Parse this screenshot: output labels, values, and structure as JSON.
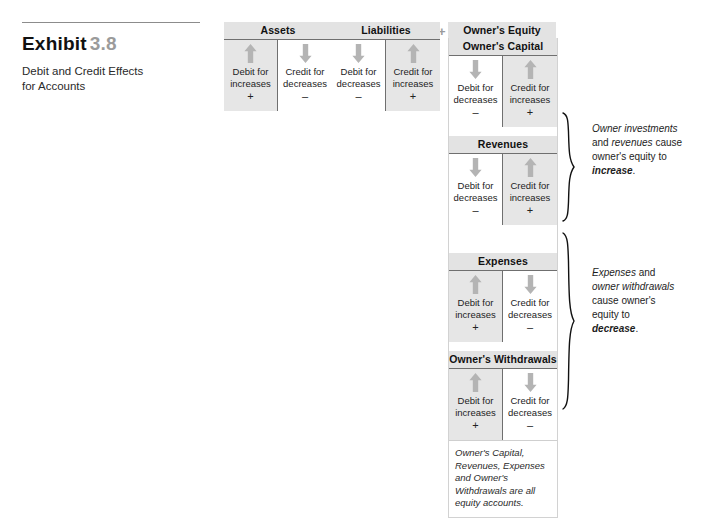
{
  "exhibit": {
    "label": "Exhibit",
    "number": "3.8",
    "subtitle_line1": "Debit and Credit Effects",
    "subtitle_line2": "for Accounts"
  },
  "operators": {
    "equals": "=",
    "plus": "+"
  },
  "accounts": [
    {
      "id": "assets",
      "title": "Assets",
      "debit": {
        "line1": "Debit for",
        "line2": "increases",
        "sign": "+",
        "arrow": "up-arrow-icon",
        "shaded": true
      },
      "credit": {
        "line1": "Credit for",
        "line2": "decreases",
        "sign": "–",
        "arrow": "down-arrow-icon",
        "shaded": false
      }
    },
    {
      "id": "liabilities",
      "title": "Liabilities",
      "debit": {
        "line1": "Debit for",
        "line2": "decreases",
        "sign": "–",
        "arrow": "down-arrow-icon",
        "shaded": false
      },
      "credit": {
        "line1": "Credit for",
        "line2": "increases",
        "sign": "+",
        "arrow": "up-arrow-icon",
        "shaded": true
      }
    },
    {
      "id": "owners-capital",
      "title": "Owner's Capital",
      "debit": {
        "line1": "Debit for",
        "line2": "decreases",
        "sign": "–",
        "arrow": "down-arrow-icon",
        "shaded": false
      },
      "credit": {
        "line1": "Credit for",
        "line2": "increases",
        "sign": "+",
        "arrow": "up-arrow-icon",
        "shaded": true
      }
    },
    {
      "id": "revenues",
      "title": "Revenues",
      "debit": {
        "line1": "Debit for",
        "line2": "decreases",
        "sign": "–",
        "arrow": "down-arrow-icon",
        "shaded": false
      },
      "credit": {
        "line1": "Credit for",
        "line2": "increases",
        "sign": "+",
        "arrow": "up-arrow-icon",
        "shaded": true
      }
    },
    {
      "id": "expenses",
      "title": "Expenses",
      "debit": {
        "line1": "Debit for",
        "line2": "increases",
        "sign": "+",
        "arrow": "up-arrow-icon",
        "shaded": true
      },
      "credit": {
        "line1": "Credit for",
        "line2": "decreases",
        "sign": "–",
        "arrow": "down-arrow-icon",
        "shaded": false
      }
    },
    {
      "id": "owners-withdrawals",
      "title": "Owner's Withdrawals",
      "debit": {
        "line1": "Debit for",
        "line2": "increases",
        "sign": "+",
        "arrow": "up-arrow-icon",
        "shaded": true
      },
      "credit": {
        "line1": "Credit for",
        "line2": "decreases",
        "sign": "–",
        "arrow": "down-arrow-icon",
        "shaded": false
      }
    }
  ],
  "owners_equity": {
    "title": "Owner's Equity",
    "footnote": "Owner's Capital, Revenues, Expenses and Owner's Withdrawals are all equity accounts."
  },
  "annotations": {
    "increase": {
      "seg1": "Owner investments",
      "seg2": "and ",
      "seg3": "revenues",
      "seg4": " cause",
      "seg5": "owner's equity to",
      "emphasis": "increase",
      "period": "."
    },
    "decrease": {
      "seg1": "Expenses",
      "seg2": " and",
      "seg3": "owner withdrawals",
      "seg4": "cause owner's",
      "seg5": "equity to",
      "emphasis": "decrease",
      "period": "."
    }
  },
  "colors": {
    "shade": "#e6e6e6",
    "header": "#e3e3e3",
    "arrow": "#b4b4b4",
    "rule": "#6f6f6f",
    "muted": "#9a9a9a"
  }
}
